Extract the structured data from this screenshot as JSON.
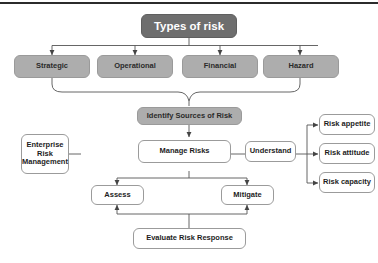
{
  "diagram": {
    "title": "Types of risk",
    "risk_types": [
      {
        "label": "Strategic"
      },
      {
        "label": "Operational"
      },
      {
        "label": "Financial"
      },
      {
        "label": "Hazard"
      }
    ],
    "identify": "Identify Sources of Risk",
    "erm": "Enterprise\nRisk\nManagement",
    "manage": "Manage Risks",
    "understand": "Understand",
    "understand_children": [
      {
        "label": "Risk appetite"
      },
      {
        "label": "Risk attitude"
      },
      {
        "label": "Risk capacity"
      }
    ],
    "assess": "Assess",
    "mitigate": "Mitigate",
    "evaluate": "Evaluate Risk Response"
  },
  "colors": {
    "header_fill": "#6e6e6e",
    "header_text": "#ffffff",
    "category_fill": "#adadad",
    "category_text": "#2a2a2a",
    "node_fill": "#ffffff",
    "node_border": "#9b9b9b",
    "connector": "#555555",
    "top_rule": "#2b2b2b"
  }
}
